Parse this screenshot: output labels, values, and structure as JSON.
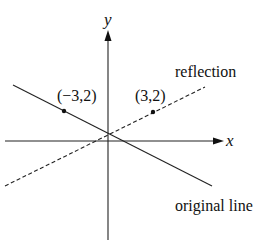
{
  "diagram": {
    "type": "coordinate-plane-reflection",
    "axes": {
      "x_label": "x",
      "y_label": "y"
    },
    "labels": {
      "reflection": "reflection",
      "original": "original line",
      "point_left": "(−3,2)",
      "point_right": "(3,2)"
    },
    "lines": [
      {
        "name": "original line",
        "style": "solid"
      },
      {
        "name": "reflection",
        "style": "dashed"
      }
    ],
    "points": [
      {
        "label": "(−3,2)",
        "x": -3,
        "y": 2
      },
      {
        "label": "(3,2)",
        "x": 3,
        "y": 2
      }
    ]
  }
}
